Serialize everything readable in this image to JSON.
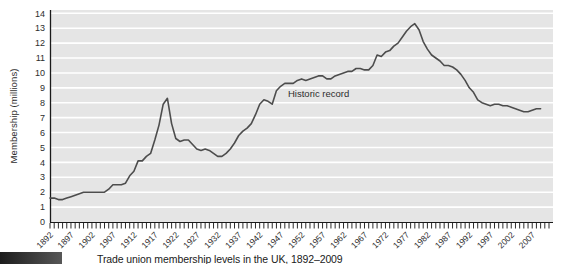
{
  "figure": {
    "caption": "Trade union membership levels in the UK, 1892–2009"
  },
  "chart_data": {
    "type": "line",
    "title": "",
    "xlabel": "",
    "ylabel": "Membership (millions)",
    "ylim": [
      0,
      14
    ],
    "y_tick_step": 1,
    "y_tick_labels": [
      "0",
      "1",
      "2",
      "3",
      "4",
      "5",
      "6",
      "7",
      "8",
      "9",
      "10",
      "11",
      "12",
      "13",
      "14"
    ],
    "xlim": [
      1892,
      2011
    ],
    "x_minor_tick_step": 1,
    "x_label_years": [
      1892,
      1897,
      1902,
      1907,
      1912,
      1917,
      1922,
      1927,
      1932,
      1937,
      1942,
      1947,
      1952,
      1957,
      1962,
      1967,
      1972,
      1977,
      1982,
      1987,
      1992,
      1997,
      2002,
      2007
    ],
    "grid": "horizontal-white-on-gray",
    "legend": "none",
    "annotation": {
      "text": "Historic record",
      "x": 1949,
      "y": 8.4
    },
    "series": [
      {
        "name": "Historic record",
        "x_start": 1892,
        "x_end": 2009,
        "x_step": 1,
        "values": [
          1.6,
          1.6,
          1.5,
          1.5,
          1.6,
          1.7,
          1.8,
          1.9,
          2.0,
          2.0,
          2.0,
          2.0,
          2.0,
          2.0,
          2.2,
          2.5,
          2.5,
          2.5,
          2.6,
          3.1,
          3.4,
          4.1,
          4.1,
          4.4,
          4.6,
          5.5,
          6.5,
          7.9,
          8.3,
          6.6,
          5.6,
          5.4,
          5.5,
          5.5,
          5.2,
          4.9,
          4.8,
          4.9,
          4.8,
          4.6,
          4.4,
          4.4,
          4.6,
          4.9,
          5.3,
          5.8,
          6.1,
          6.3,
          6.6,
          7.2,
          7.9,
          8.2,
          8.1,
          7.9,
          8.8,
          9.1,
          9.3,
          9.3,
          9.3,
          9.5,
          9.6,
          9.5,
          9.6,
          9.7,
          9.8,
          9.8,
          9.6,
          9.6,
          9.8,
          9.9,
          10.0,
          10.1,
          10.1,
          10.3,
          10.3,
          10.2,
          10.2,
          10.5,
          11.2,
          11.1,
          11.4,
          11.5,
          11.8,
          12.0,
          12.4,
          12.8,
          13.1,
          13.3,
          12.9,
          12.1,
          11.6,
          11.2,
          11.0,
          10.8,
          10.5,
          10.5,
          10.4,
          10.2,
          9.9,
          9.5,
          9.0,
          8.7,
          8.2,
          8.0,
          7.9,
          7.8,
          7.9,
          7.9,
          7.8,
          7.8,
          7.7,
          7.6,
          7.5,
          7.4,
          7.4,
          7.5,
          7.6,
          7.6
        ]
      }
    ],
    "colors": {
      "line": "#4d4d4d",
      "plot_bg": "#e5e5e5",
      "grid": "#ffffff",
      "axis": "#1a1a1a",
      "tick": "#2b2b2b",
      "text": "#2d2d2d",
      "caption_box_dark": "#1c1c1c",
      "caption_box_light": "#575757",
      "page_bg": "#ffffff"
    }
  }
}
